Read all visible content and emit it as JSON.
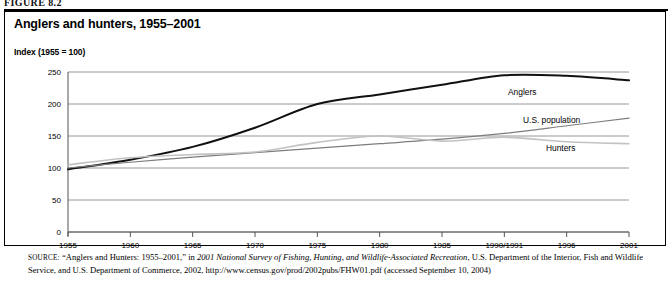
{
  "figure": {
    "number": "FIGURE 8.2"
  },
  "chart_title": "Anglers and hunters, 1955–2001",
  "axis_note": "Index (1955  =  100)",
  "series_labels": {
    "anglers": "Anglers",
    "us_population": "U.S. population",
    "hunters": "Hunters"
  },
  "source": {
    "label": "SOURCE:",
    "line": " “Anglers and Hunters: 1955–2001,” in 2001 National Survey of Fishing, Hunting, and Wildlife-Associated Recreation, U.S. Department of the Interior, Fish and Wildlife Service, and U.S. Department of Commerce, 2002, http://www.census.gov/prod/2002pubs/FHW01.pdf (accessed September 10, 2004)",
    "part_pre": " “Anglers and Hunters: 1955–2001,” in ",
    "part_italic": "2001 National Survey of Fishing, Hunting, and Wildlife-Associated Recreation",
    "part_post": ", U.S. Department of the Interior, Fish and Wildlife Service, and U.S. Department of Commerce, 2002, http://www.census.gov/prod/2002pubs/FHW01.pdf (accessed September 10, 2004)"
  },
  "colors": {
    "anglers": "#111111",
    "us_population": "#7d7d7d",
    "hunters": "#c2c2c2",
    "gridline": "#8c8c8c",
    "axis": "#555555",
    "frame": "#000000"
  },
  "chart_data": {
    "type": "line",
    "title": "Anglers and hunters, 1955–2001",
    "xlabel": "",
    "ylabel": "Index (1955 = 100)",
    "ylim": [
      0,
      250
    ],
    "yticks": [
      0,
      50,
      100,
      150,
      200,
      250
    ],
    "grid": true,
    "legend": "inline-right",
    "categories": [
      "1955",
      "1960",
      "1965",
      "1970",
      "1975",
      "1980",
      "1985",
      "1990/1991",
      "1996",
      "2001"
    ],
    "series": [
      {
        "name": "Anglers",
        "color": "#111111",
        "values": [
          98,
          113,
          133,
          163,
          200,
          215,
          230,
          245,
          244,
          237
        ]
      },
      {
        "name": "U.S. population",
        "color": "#7d7d7d",
        "values": [
          100,
          109,
          117,
          124,
          131,
          138,
          145,
          154,
          166,
          178
        ]
      },
      {
        "name": "Hunters",
        "color": "#c2c2c2",
        "values": [
          105,
          116,
          121,
          125,
          140,
          150,
          142,
          148,
          141,
          138
        ]
      }
    ]
  }
}
